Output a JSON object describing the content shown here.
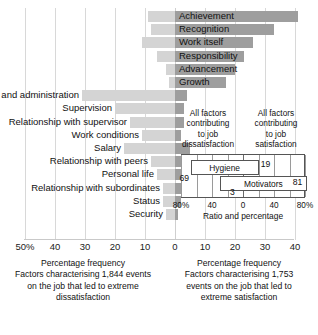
{
  "chart_data": {
    "type": "bar",
    "title": "",
    "orientation": "horizontal-diverging",
    "xlabel": "Percentage frequency",
    "ylabel": "",
    "xlim": [
      -50,
      45
    ],
    "grid": true,
    "legend_position": "none",
    "axis_ticks": [
      {
        "label": "50%",
        "value": -50
      },
      {
        "label": "40",
        "value": -40
      },
      {
        "label": "30",
        "value": -30
      },
      {
        "label": "20",
        "value": -20
      },
      {
        "label": "10",
        "value": -10
      },
      {
        "label": "0",
        "value": 0
      },
      {
        "label": "10",
        "value": 10
      },
      {
        "label": "20",
        "value": 20
      },
      {
        "label": "30",
        "value": 30
      },
      {
        "label": "40",
        "value": 40
      }
    ],
    "series": [
      {
        "name": "Extreme dissatisfaction (left, light)",
        "color": "#d4d4d4"
      },
      {
        "name": "Extreme satisfaction (right, dark)",
        "color": "#9e9e9e"
      }
    ],
    "categories": [
      "Achievement",
      "Recognition",
      "Work itself",
      "Responsibility",
      "Advancement",
      "Growth",
      "Company policy and administration",
      "Supervision",
      "Relationship with supervisor",
      "Work conditions",
      "Salary",
      "Relationship with peers",
      "Personal life",
      "Relationship with subordinates",
      "Status",
      "Security"
    ],
    "bars": [
      {
        "category": "Achievement",
        "group": "motivator",
        "label_side": "right",
        "dissatisfaction": 9,
        "satisfaction": 41
      },
      {
        "category": "Recognition",
        "group": "motivator",
        "label_side": "right",
        "dissatisfaction": 8,
        "satisfaction": 33
      },
      {
        "category": "Work itself",
        "group": "motivator",
        "label_side": "right",
        "dissatisfaction": 11,
        "satisfaction": 26
      },
      {
        "category": "Responsibility",
        "group": "motivator",
        "label_side": "right",
        "dissatisfaction": 6,
        "satisfaction": 23
      },
      {
        "category": "Advancement",
        "group": "motivator",
        "label_side": "right",
        "dissatisfaction": 3,
        "satisfaction": 20
      },
      {
        "category": "Growth",
        "group": "motivator",
        "label_side": "right",
        "dissatisfaction": 2,
        "satisfaction": 17
      },
      {
        "category": "Company policy and administration",
        "group": "hygiene",
        "label_side": "left",
        "dissatisfaction": 31,
        "satisfaction": 4
      },
      {
        "category": "Supervision",
        "group": "hygiene",
        "label_side": "left",
        "dissatisfaction": 20,
        "satisfaction": 3
      },
      {
        "category": "Relationship with supervisor",
        "group": "hygiene",
        "label_side": "left",
        "dissatisfaction": 15,
        "satisfaction": 3
      },
      {
        "category": "Work conditions",
        "group": "hygiene",
        "label_side": "left",
        "dissatisfaction": 11,
        "satisfaction": 2
      },
      {
        "category": "Salary",
        "group": "hygiene",
        "label_side": "left",
        "dissatisfaction": 17,
        "satisfaction": 5
      },
      {
        "category": "Relationship with peers",
        "group": "hygiene",
        "label_side": "left",
        "dissatisfaction": 8,
        "satisfaction": 3
      },
      {
        "category": "Personal life",
        "group": "hygiene",
        "label_side": "left",
        "dissatisfaction": 6,
        "satisfaction": 2
      },
      {
        "category": "Relationship with subordinates",
        "group": "hygiene",
        "label_side": "left",
        "dissatisfaction": 4,
        "satisfaction": 2
      },
      {
        "category": "Status",
        "group": "hygiene",
        "label_side": "left",
        "dissatisfaction": 4,
        "satisfaction": 2
      },
      {
        "category": "Security",
        "group": "hygiene",
        "label_side": "left",
        "dissatisfaction": 3,
        "satisfaction": 1
      }
    ],
    "inset": {
      "type": "bar",
      "header_left": "All factors\ncontributing\nto job\ndissatisfaction",
      "header_right": "All factors\ncontributing\nto job\nsatisfaction",
      "axis_title": "Ratio and  percentage",
      "xlim": [
        -80,
        80
      ],
      "ticks": [
        {
          "label": "80%",
          "value": -80
        },
        {
          "label": "40",
          "value": -40
        },
        {
          "label": "0",
          "value": 0
        },
        {
          "label": "40",
          "value": 40
        },
        {
          "label": "80%",
          "value": 80
        }
      ],
      "bars": [
        {
          "name": "Hygiene",
          "dissatisfaction": 69,
          "satisfaction": 19
        },
        {
          "name": "Motivators",
          "dissatisfaction": 31,
          "satisfaction": 81
        }
      ],
      "value_labels": [
        {
          "text": "69",
          "series": "Hygiene",
          "side": "left"
        },
        {
          "text": "19",
          "series": "Hygiene",
          "side": "right"
        },
        {
          "text": "3",
          "series": "Motivators",
          "side": "left"
        },
        {
          "text": "81",
          "series": "Motivators",
          "side": "right"
        }
      ]
    },
    "caption_left": "Percentage frequency\nFactors characterising 1,844 events\non the job that led to extreme\ndissatisfaction",
    "caption_right": "Percentage frequency\nFactors characterising 1,753\nevents on the job that led to\nextreme satisfaction"
  },
  "captions": {
    "left_lines": [
      "Percentage frequency",
      "Factors characterising 1,844 events",
      "on the job that led to extreme",
      "dissatisfaction"
    ],
    "right_lines": [
      "Percentage frequency",
      "Factors characterising 1,753",
      "events on the job that led to",
      "extreme satisfaction"
    ]
  },
  "inset_headers": {
    "left_lines": [
      "All factors",
      "contributing",
      "to job",
      "dissatisfaction"
    ],
    "right_lines": [
      "All factors",
      "contributing",
      "to job",
      "satisfaction"
    ]
  },
  "colors": {
    "bar_left": "#d4d4d4",
    "bar_right": "#9e9e9e",
    "gridline": "#d8d8d8",
    "text": "#111111",
    "inset_border": "#555555"
  }
}
